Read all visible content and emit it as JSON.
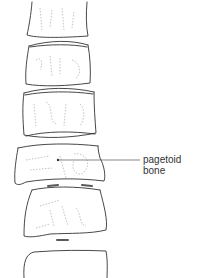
{
  "diagram": {
    "type": "anatomical illustration",
    "vertebrae_count": 6,
    "annotation": {
      "line1": "pagetoid",
      "line2": "bone",
      "target": "fourth vertebral body"
    },
    "colors": {
      "outline": "#333333",
      "texture": "#9a9a9a",
      "leader_line": "#555555",
      "background": "#ffffff"
    }
  }
}
